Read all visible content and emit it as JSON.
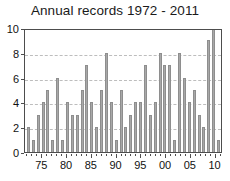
{
  "chart_data": {
    "type": "bar",
    "title": "Annual records 1972 - 2011",
    "xlabel": "",
    "ylabel": "",
    "ylim": [
      0,
      10
    ],
    "ytick_values": [
      0,
      2,
      4,
      6,
      8,
      10
    ],
    "ytick_labels": [
      "0",
      "2",
      "4",
      "6",
      "8",
      "10"
    ],
    "grid": true,
    "legend": false,
    "xtick_labels": [
      "75",
      "80",
      "85",
      "90",
      "95",
      "00",
      "05",
      "10"
    ],
    "xtick_years": [
      1975,
      1980,
      1985,
      1990,
      1995,
      2000,
      2005,
      2010
    ],
    "categories": [
      "1972",
      "1973",
      "1974",
      "1975",
      "1976",
      "1977",
      "1978",
      "1979",
      "1980",
      "1981",
      "1982",
      "1983",
      "1984",
      "1985",
      "1986",
      "1987",
      "1988",
      "1989",
      "1990",
      "1991",
      "1992",
      "1993",
      "1994",
      "1995",
      "1996",
      "1997",
      "1998",
      "1999",
      "2000",
      "2001",
      "2002",
      "2003",
      "2004",
      "2005",
      "2006",
      "2007",
      "2008",
      "2009",
      "2010",
      "2011"
    ],
    "values": [
      2,
      1,
      3,
      4,
      5,
      1,
      6,
      1,
      4,
      3,
      3,
      5,
      7,
      4,
      2,
      5,
      8,
      4,
      1,
      5,
      2,
      3,
      4,
      4,
      7,
      3,
      4,
      8,
      7,
      7,
      1,
      8,
      6,
      4,
      5,
      3,
      2,
      9,
      10,
      1
    ]
  },
  "style": {
    "bar_fill": "#a8a8a8",
    "bar_edge": "#8e8e8e",
    "grid_color": "#bdbdbd",
    "axis_color": "#4d4d4d",
    "text_color": "#111111",
    "background": "#ffffff"
  }
}
